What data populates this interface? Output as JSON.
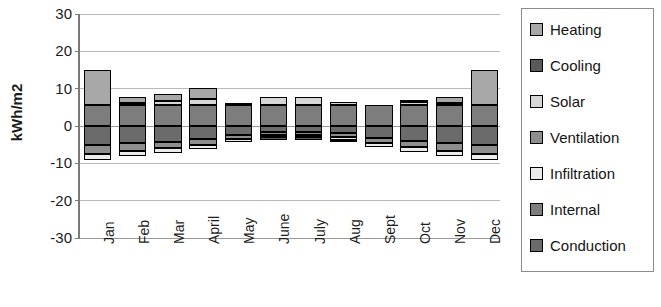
{
  "chart_data": {
    "type": "bar",
    "stacked": true,
    "title": "",
    "xlabel": "",
    "ylabel": "kWh/m2",
    "ylim": [
      -30,
      30
    ],
    "ytick_step": 10,
    "yticks": [
      "30",
      "20",
      "10",
      "0",
      "-10",
      "-20",
      "-30"
    ],
    "grid": true,
    "legend_position": "right",
    "categories": [
      "Jan",
      "Feb",
      "Mar",
      "April",
      "May",
      "June",
      "July",
      "Aug",
      "Sept",
      "Oct",
      "Nov",
      "Dec"
    ],
    "series": [
      {
        "name": "Heating",
        "color": "#a8a8a8",
        "values": [
          9.5,
          1.5,
          2.0,
          3.0,
          0.6,
          0.0,
          0.0,
          0.0,
          0.0,
          0.5,
          1.6,
          9.3
        ]
      },
      {
        "name": "Cooling",
        "color": "#5a5a5a",
        "values": [
          0.0,
          0.0,
          0.0,
          0.0,
          0.0,
          -0.9,
          -0.9,
          -0.5,
          0.0,
          0.0,
          0.0,
          0.0
        ]
      },
      {
        "name": "Solar",
        "color": "#d6d6d6",
        "values": [
          0.0,
          0.6,
          1.0,
          1.6,
          0.0,
          2.2,
          2.2,
          0.9,
          0.0,
          0.9,
          0.5,
          0.0
        ]
      },
      {
        "name": "Ventilation",
        "color": "#8e8e8e",
        "values": [
          -2.2,
          -2.0,
          -1.8,
          -1.5,
          -1.1,
          -0.8,
          -0.8,
          -1.0,
          -1.4,
          -1.7,
          -2.0,
          -2.2
        ]
      },
      {
        "name": "Infiltration",
        "color": "#ebebeb",
        "values": [
          -1.6,
          -1.5,
          -1.3,
          -1.1,
          -0.8,
          -0.5,
          -0.5,
          -0.7,
          -1.0,
          -1.2,
          -1.5,
          -1.6
        ]
      },
      {
        "name": "Internal",
        "color": "#7d7d7d",
        "values": [
          5.6,
          5.6,
          5.6,
          5.6,
          5.6,
          5.6,
          5.6,
          5.6,
          5.6,
          5.6,
          5.6,
          5.6
        ]
      },
      {
        "name": "Conduction",
        "color": "#6b6b6b",
        "values": [
          -5.2,
          -4.6,
          -4.2,
          -3.6,
          -2.5,
          -1.6,
          -1.6,
          -2.0,
          -3.1,
          -4.0,
          -4.6,
          -5.2
        ]
      }
    ],
    "stack_order_positive": [
      "Internal",
      "Solar",
      "Heating"
    ],
    "stack_order_negative": [
      "Conduction",
      "Ventilation",
      "Infiltration",
      "Cooling"
    ]
  },
  "legend": {
    "items": [
      {
        "label": "Heating",
        "color": "#a8a8a8"
      },
      {
        "label": "Cooling",
        "color": "#5a5a5a"
      },
      {
        "label": "Solar",
        "color": "#d6d6d6"
      },
      {
        "label": "Ventilation",
        "color": "#8e8e8e"
      },
      {
        "label": "Infiltration",
        "color": "#ebebeb"
      },
      {
        "label": "Internal",
        "color": "#7d7d7d"
      },
      {
        "label": "Conduction",
        "color": "#6b6b6b"
      }
    ]
  }
}
